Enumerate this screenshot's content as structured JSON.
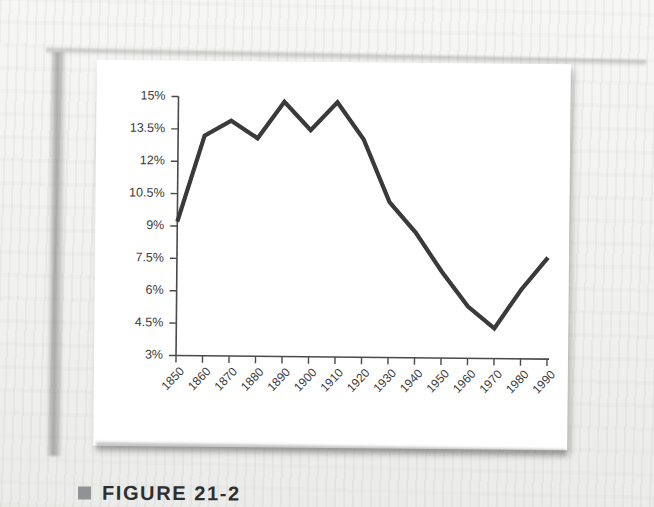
{
  "figure": {
    "caption_marker": "square-marker",
    "caption": "FIGURE 21-2"
  },
  "chart_data": {
    "type": "line",
    "title": "",
    "xlabel": "",
    "ylabel": "",
    "x": [
      1850,
      1860,
      1870,
      1880,
      1890,
      1900,
      1910,
      1920,
      1930,
      1940,
      1950,
      1960,
      1970,
      1980,
      1990
    ],
    "categories": [
      "1850",
      "1860",
      "1870",
      "1880",
      "1890",
      "1900",
      "1910",
      "1920",
      "1930",
      "1940",
      "1950",
      "1960",
      "1970",
      "1980",
      "1990"
    ],
    "values": [
      9.2,
      13.2,
      13.9,
      13.1,
      14.8,
      13.5,
      14.8,
      13.1,
      10.2,
      8.8,
      7.0,
      5.4,
      4.4,
      6.2,
      7.7
    ],
    "series": [
      {
        "name": "Foreign-born share of population",
        "values": [
          9.2,
          13.2,
          13.9,
          13.1,
          14.8,
          13.5,
          14.8,
          13.1,
          10.2,
          8.8,
          7.0,
          5.4,
          4.4,
          6.2,
          7.7
        ]
      }
    ],
    "ytick_labels": [
      "15%",
      "13.5%",
      "12%",
      "10.5%",
      "9%",
      "7.5%",
      "6%",
      "4.5%",
      "3%"
    ],
    "ytick_values": [
      15,
      13.5,
      12,
      10.5,
      9,
      7.5,
      6,
      4.5,
      3
    ],
    "ylim": [
      3,
      15
    ],
    "xlim": [
      1850,
      1990
    ],
    "grid": false,
    "legend": "none",
    "line_color": "#3a3a3a",
    "axis_color": "#4a4a4a",
    "panel_color": "#ffffff"
  }
}
